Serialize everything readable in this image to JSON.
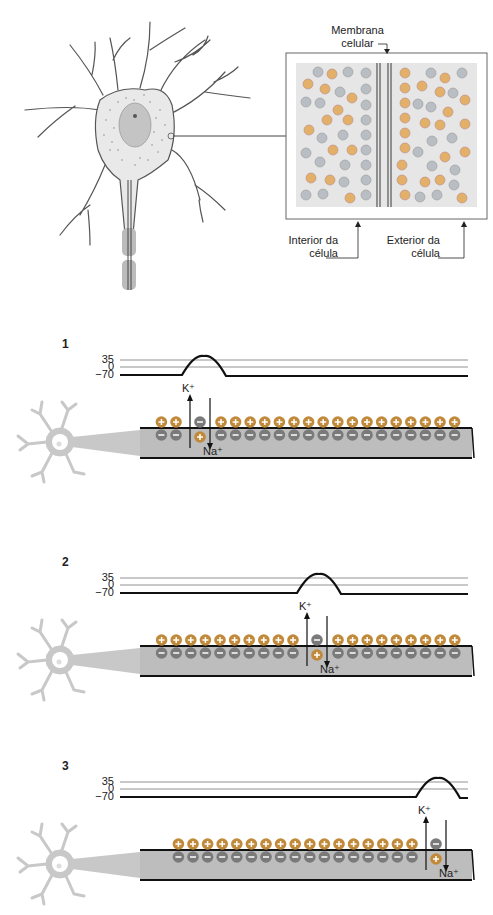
{
  "top": {
    "membrane_label_line1": "Membrana",
    "membrane_label_line2": "celular",
    "interior_label_line1": "Interior da",
    "interior_label_line2": "célula",
    "exterior_label_line1": "Exterior da",
    "exterior_label_line2": "célula"
  },
  "colors": {
    "positive_ion": "#c08a3a",
    "negative_ion": "#7a7a7a",
    "axon_fill": "#bdbdbd",
    "neuron_silhouette": "#c8c8c8",
    "box_fill": "#e6e6e6",
    "ion_orange": "#e3b06a",
    "ion_gray": "#b9bec4"
  },
  "panels": [
    {
      "number": "1",
      "axis_ticks": [
        "35",
        "0",
        "−70"
      ],
      "k_label": "K⁺",
      "na_label": "Na⁺",
      "spike_x": 204,
      "channel_x": 190,
      "left_ions": 2,
      "right_ions": 17,
      "ions_count_note": "right_ions estimated from overview; not directly counted"
    },
    {
      "number": "2",
      "axis_ticks": [
        "35",
        "0",
        "−70"
      ],
      "k_label": "K⁺",
      "na_label": "Na⁺",
      "spike_x": 319,
      "channel_x": 307,
      "left_ions": 10,
      "right_ions": 10
    },
    {
      "number": "3",
      "axis_ticks": [
        "35",
        "0",
        "−70"
      ],
      "k_label": "K⁺",
      "na_label": "Na⁺",
      "spike_x": 438,
      "channel_x": 426,
      "left_ions": 17,
      "right_ions": 0,
      "ions_count_note": "left_ions estimated from overview; not directly counted"
    }
  ],
  "chart_data": [
    {
      "type": "line",
      "title": "1",
      "ylabel": "mV",
      "yticks": [
        35,
        0,
        -70
      ],
      "ylim": [
        -70,
        35
      ],
      "x": [
        0,
        65,
        78,
        90,
        108,
        320
      ],
      "values": [
        -70,
        -70,
        20,
        20,
        -70,
        -70
      ],
      "note": "single action potential peak near left of axon"
    },
    {
      "type": "line",
      "title": "2",
      "ylabel": "mV",
      "yticks": [
        35,
        0,
        -70
      ],
      "ylim": [
        -70,
        35
      ],
      "x": [
        0,
        180,
        193,
        205,
        223,
        320
      ],
      "values": [
        -70,
        -70,
        20,
        20,
        -70,
        -70
      ],
      "note": "action potential peak mid axon"
    },
    {
      "type": "line",
      "title": "3",
      "ylabel": "mV",
      "yticks": [
        35,
        0,
        -70
      ],
      "ylim": [
        -70,
        35
      ],
      "x": [
        0,
        300,
        313,
        325,
        343,
        350
      ],
      "values": [
        -70,
        -70,
        20,
        20,
        -70,
        -70
      ],
      "note": "action potential peak near right end of axon"
    }
  ]
}
